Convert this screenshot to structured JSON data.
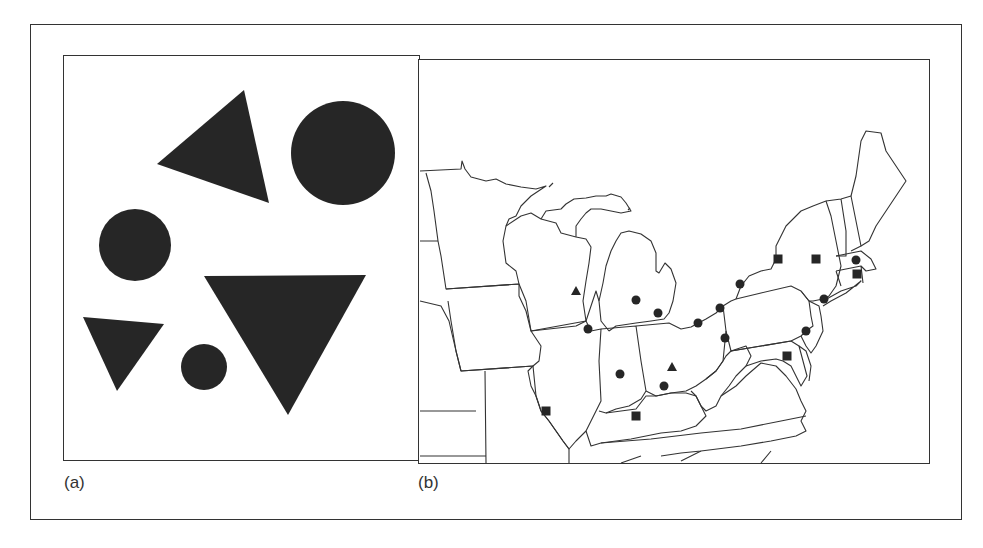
{
  "figure": {
    "panels": [
      {
        "id": "a",
        "label": "(a)",
        "description": "Abstract shapes: triangles and circles",
        "shapes": [
          {
            "type": "triangle",
            "points": "243,89 268,202 156,163"
          },
          {
            "type": "circle",
            "cx": 342,
            "cy": 152,
            "r": 52
          },
          {
            "type": "circle",
            "cx": 134,
            "cy": 244,
            "r": 36
          },
          {
            "type": "triangle",
            "points": "203,275 365,274 287,414"
          },
          {
            "type": "triangle",
            "points": "82,316 163,323 116,390"
          },
          {
            "type": "circle",
            "cx": 203,
            "cy": 366,
            "r": 23
          }
        ],
        "fill_color": "#262626"
      },
      {
        "id": "b",
        "label": "(b)",
        "description": "Map of northeastern/midwestern United States with point symbols",
        "symbol_legend": [
          "circle",
          "square",
          "triangle"
        ],
        "symbols": [
          {
            "type": "triangle",
            "x": 575,
            "y": 290
          },
          {
            "type": "circle",
            "x": 587,
            "y": 328
          },
          {
            "type": "circle",
            "x": 635,
            "y": 299
          },
          {
            "type": "circle",
            "x": 657,
            "y": 312
          },
          {
            "type": "circle",
            "x": 619,
            "y": 373
          },
          {
            "type": "triangle",
            "x": 671,
            "y": 366
          },
          {
            "type": "circle",
            "x": 663,
            "y": 385
          },
          {
            "type": "square",
            "x": 545,
            "y": 410
          },
          {
            "type": "square",
            "x": 635,
            "y": 415
          },
          {
            "type": "circle",
            "x": 697,
            "y": 322
          },
          {
            "type": "circle",
            "x": 719,
            "y": 307
          },
          {
            "type": "circle",
            "x": 724,
            "y": 337
          },
          {
            "type": "circle",
            "x": 739,
            "y": 283
          },
          {
            "type": "square",
            "x": 777,
            "y": 258
          },
          {
            "type": "square",
            "x": 815,
            "y": 258
          },
          {
            "type": "circle",
            "x": 855,
            "y": 259
          },
          {
            "type": "square",
            "x": 856,
            "y": 273
          },
          {
            "type": "circle",
            "x": 823,
            "y": 298
          },
          {
            "type": "circle",
            "x": 805,
            "y": 330
          },
          {
            "type": "square",
            "x": 786,
            "y": 355
          }
        ],
        "fill_color": "#262626",
        "line_color": "#333333"
      }
    ]
  }
}
